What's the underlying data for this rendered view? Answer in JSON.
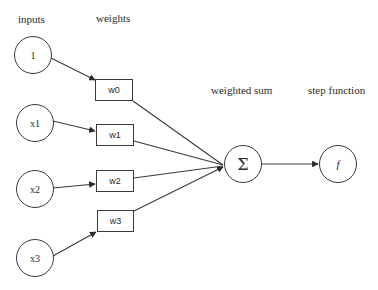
{
  "diagram": {
    "type": "perceptron",
    "headers": {
      "inputs": "inputs",
      "weights": "weights",
      "weighted_sum": "weighted sum",
      "step_function": "step function"
    },
    "inputs": [
      {
        "id": "in0",
        "label": "1"
      },
      {
        "id": "in1",
        "label": "x1"
      },
      {
        "id": "in2",
        "label": "x2"
      },
      {
        "id": "in3",
        "label": "x3"
      }
    ],
    "weights": [
      {
        "id": "w0",
        "label": "w0"
      },
      {
        "id": "w1",
        "label": "w1"
      },
      {
        "id": "w2",
        "label": "w2"
      },
      {
        "id": "w3",
        "label": "w3"
      }
    ],
    "sum_node": {
      "label": "Σ"
    },
    "activation_node": {
      "label": "f"
    },
    "edges": [
      {
        "from": "1",
        "to": "w0"
      },
      {
        "from": "x1",
        "to": "w1"
      },
      {
        "from": "x2",
        "to": "w2"
      },
      {
        "from": "x3",
        "to": "w3"
      },
      {
        "from": "w0",
        "to": "Σ"
      },
      {
        "from": "w1",
        "to": "Σ"
      },
      {
        "from": "w2",
        "to": "Σ"
      },
      {
        "from": "w3",
        "to": "Σ"
      },
      {
        "from": "Σ",
        "to": "f"
      }
    ],
    "colors": {
      "stroke": "#3a3a3a",
      "text": "#2a2a2a",
      "background": "#ffffff"
    }
  }
}
